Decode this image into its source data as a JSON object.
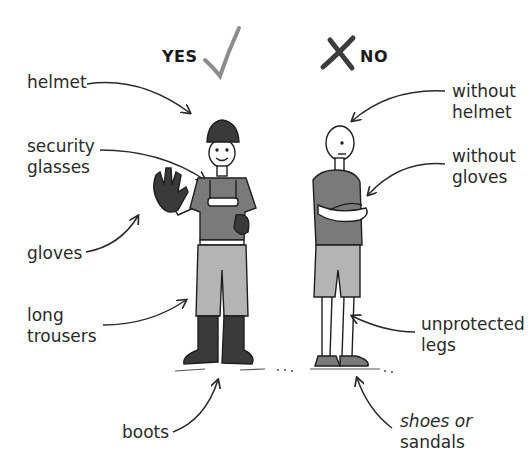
{
  "header": {
    "yes_label": "YES",
    "no_label": "NO",
    "yes_icon": "checkmark-icon",
    "no_icon": "cross-icon"
  },
  "left_labels": {
    "helmet": "helmet",
    "glasses_1": "security",
    "glasses_2": "glasses",
    "gloves": "gloves",
    "trousers_1": "long",
    "trousers_2": "trousers",
    "boots": "boots"
  },
  "right_labels": {
    "no_helmet_1": "without",
    "no_helmet_2": "helmet",
    "no_gloves_1": "without",
    "no_gloves_2": "gloves",
    "legs_1": "unprotected",
    "legs_2": "legs",
    "shoes_1": "shoes or",
    "shoes_2": "sandals"
  },
  "colors": {
    "shirt": "#7a7a7a",
    "trousers": "#b4b4b4",
    "dark_gear": "#3a3a3a",
    "skin": "#ffffff",
    "check": "#8c8c8c",
    "cross": "#3c3c3c"
  }
}
